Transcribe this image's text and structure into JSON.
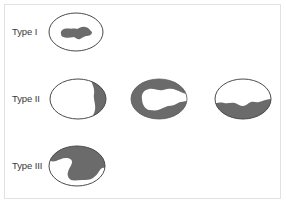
{
  "diagram": {
    "colors": {
      "outline": "#4a4a4a",
      "fill": "#6b6b6b",
      "frame": "#e2e2e2",
      "text": "#3a3a3a"
    },
    "rows": [
      {
        "label": "Type I",
        "shapes": [
          {
            "pattern": "central-blob"
          }
        ]
      },
      {
        "label": "Type II",
        "shapes": [
          {
            "pattern": "right-crescent"
          },
          {
            "pattern": "peripheral-ring"
          },
          {
            "pattern": "bottom-band"
          }
        ]
      },
      {
        "label": "Type III",
        "shapes": [
          {
            "pattern": "large-irregular-fill"
          }
        ]
      }
    ]
  }
}
